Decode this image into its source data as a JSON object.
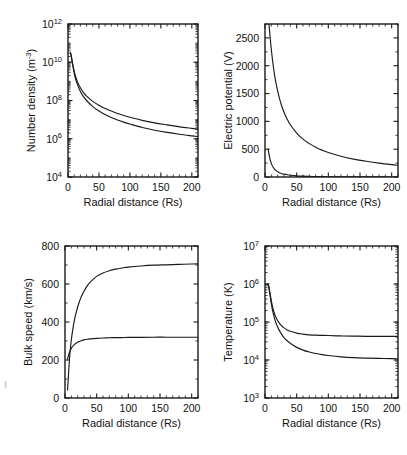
{
  "figure": {
    "background": "#ffffff",
    "ink_color": "#1a1a1a",
    "panel_count": 4
  },
  "common": {
    "xlabel": "Radial distance (Rs)",
    "xticks": [
      0,
      50,
      100,
      150,
      200
    ],
    "xlim": [
      0,
      210
    ]
  },
  "chart_data": [
    {
      "id": "number-density",
      "type": "line",
      "position": "top-left",
      "title": "",
      "xlabel": "Radial distance (Rs)",
      "ylabel": "Number density (m-3)",
      "ylabel_base": "Number density (m",
      "ylabel_sup": "-3",
      "ylabel_tail": ")",
      "yscale": "log",
      "xlim": [
        0,
        210
      ],
      "ylim": [
        10000,
        1000000000000
      ],
      "xticks": [
        0,
        50,
        100,
        150,
        200
      ],
      "yticks": [
        10000,
        1000000,
        100000000,
        10000000000,
        1000000000000
      ],
      "yticklabels": [
        "10^4",
        "10^6",
        "10^8",
        "10^10",
        "10^12"
      ],
      "ytick_mant": [
        "10",
        "10",
        "10",
        "10",
        "10"
      ],
      "ytick_exp": [
        "4",
        "6",
        "8",
        "10",
        "12"
      ],
      "grid": false,
      "legend": "none",
      "series": [
        {
          "name": "upper",
          "x": [
            4,
            5,
            6,
            7,
            8,
            10,
            12,
            15,
            20,
            25,
            30,
            40,
            50,
            60,
            70,
            80,
            90,
            100,
            120,
            140,
            160,
            180,
            200,
            210
          ],
          "y": [
            32000000000.0,
            24000000000.0,
            16000000000.0,
            10500000000.0,
            7000000000.0,
            3400000000.0,
            1900000000.0,
            1000000000.0,
            460000000.0,
            260000000.0,
            170000000.0,
            90000000.0,
            56000000.0,
            38000000.0,
            28000000.0,
            21000000.0,
            16500000.0,
            13300000.0,
            9200000.0,
            6800000.0,
            5300000.0,
            4200000.0,
            3500000.0,
            3200000.0
          ]
        },
        {
          "name": "lower",
          "x": [
            4,
            5,
            6,
            7,
            8,
            10,
            12,
            15,
            20,
            25,
            30,
            40,
            50,
            60,
            70,
            80,
            90,
            100,
            120,
            140,
            160,
            180,
            200,
            210
          ],
          "y": [
            30000000000.0,
            22000000000.0,
            14500000000.0,
            9200000000.0,
            6000000000.0,
            2700000000.0,
            1450000000.0,
            720000000.0,
            300000000.0,
            160000000.0,
            100000000.0,
            48000000.0,
            28000000.0,
            18500000.0,
            13000000.0,
            9600000.0,
            7400000.0,
            5900000.0,
            3900000.0,
            2800000.0,
            2150000.0,
            1720000.0,
            1420000.0,
            1300000.0
          ]
        }
      ]
    },
    {
      "id": "electric-potential",
      "type": "line",
      "position": "top-right",
      "title": "",
      "xlabel": "Radial distance (Rs)",
      "ylabel": "Electric potential (V)",
      "yscale": "linear",
      "xlim": [
        0,
        210
      ],
      "ylim": [
        0,
        2750
      ],
      "xticks": [
        0,
        50,
        100,
        150,
        200
      ],
      "yticks": [
        0,
        500,
        1000,
        1500,
        2000,
        2500
      ],
      "yticklabels": [
        "0",
        "500",
        "1000",
        "1500",
        "2000",
        "2500"
      ],
      "grid": false,
      "legend": "none",
      "series": [
        {
          "name": "upper",
          "x": [
            5,
            6,
            7,
            8,
            9,
            10,
            12,
            15,
            18,
            22,
            26,
            30,
            35,
            40,
            50,
            60,
            70,
            80,
            90,
            100,
            120,
            140,
            160,
            180,
            200,
            210
          ],
          "y": [
            2900,
            2780,
            2650,
            2520,
            2400,
            2290,
            2090,
            1840,
            1650,
            1450,
            1290,
            1165,
            1040,
            940,
            790,
            680,
            600,
            535,
            483,
            440,
            373,
            322,
            283,
            250,
            222,
            210
          ]
        },
        {
          "name": "lower",
          "x": [
            5,
            6,
            7,
            8,
            9,
            10,
            12,
            15,
            18,
            22,
            26,
            30,
            35,
            40,
            50,
            60,
            70,
            80,
            90,
            100,
            120,
            140,
            160,
            180,
            200,
            210
          ],
          "y": [
            500,
            430,
            370,
            318,
            276,
            242,
            192,
            142,
            110,
            82,
            64,
            51,
            40,
            32,
            21,
            15,
            11,
            8,
            6.5,
            5,
            3.2,
            2.2,
            1.6,
            1.2,
            0.9,
            0.8
          ]
        }
      ]
    },
    {
      "id": "bulk-speed",
      "type": "line",
      "position": "bottom-left",
      "title": "",
      "xlabel": "Radial distance (Rs)",
      "ylabel": "Bulk speed (km/s)",
      "yscale": "linear",
      "xlim": [
        0,
        210
      ],
      "ylim": [
        0,
        800
      ],
      "xticks": [
        0,
        50,
        100,
        150,
        200
      ],
      "yticks": [
        0,
        200,
        400,
        600,
        800
      ],
      "yticklabels": [
        "0",
        "200",
        "400",
        "600",
        "800"
      ],
      "grid": false,
      "legend": "none",
      "series": [
        {
          "name": "fast",
          "x": [
            4,
            5,
            6,
            7,
            8,
            10,
            12,
            15,
            18,
            22,
            26,
            30,
            35,
            40,
            50,
            60,
            70,
            80,
            90,
            100,
            120,
            140,
            160,
            180,
            200,
            210
          ],
          "y": [
            42,
            95,
            150,
            200,
            243,
            305,
            355,
            412,
            455,
            500,
            535,
            562,
            590,
            610,
            640,
            658,
            670,
            678,
            684,
            689,
            695,
            699,
            701,
            703,
            705,
            706
          ]
        },
        {
          "name": "slow",
          "x": [
            4,
            5,
            6,
            7,
            8,
            10,
            12,
            15,
            18,
            22,
            26,
            30,
            35,
            40,
            50,
            60,
            70,
            80,
            90,
            100,
            120,
            140,
            160,
            180,
            200,
            210
          ],
          "y": [
            205,
            218,
            230,
            240,
            248,
            261,
            271,
            282,
            290,
            297,
            302,
            306,
            309,
            311,
            314,
            316,
            317,
            318,
            318,
            319,
            319,
            320,
            320,
            320,
            320,
            320
          ]
        }
      ]
    },
    {
      "id": "temperature",
      "type": "line",
      "position": "bottom-right",
      "title": "",
      "xlabel": "Radial distance (Rs)",
      "ylabel": "Temperature (K)",
      "yscale": "log",
      "xlim": [
        0,
        210
      ],
      "ylim": [
        1000,
        10000000
      ],
      "xticks": [
        0,
        50,
        100,
        150,
        200
      ],
      "yticks": [
        1000,
        10000,
        100000,
        1000000,
        10000000
      ],
      "yticklabels": [
        "10^3",
        "10^4",
        "10^5",
        "10^6",
        "10^7"
      ],
      "ytick_mant": [
        "10",
        "10",
        "10",
        "10",
        "10"
      ],
      "ytick_exp": [
        "3",
        "4",
        "5",
        "6",
        "7"
      ],
      "grid": false,
      "legend": "none",
      "series": [
        {
          "name": "upper",
          "x": [
            4,
            5,
            6,
            7,
            8,
            10,
            12,
            15,
            18,
            22,
            26,
            30,
            35,
            40,
            50,
            60,
            70,
            80,
            90,
            100,
            120,
            140,
            160,
            180,
            200,
            210
          ],
          "y": [
            1000000.0,
            980000.0,
            860000.0,
            700000.0,
            560000.0,
            360000.0,
            250000.0,
            165000.0,
            125000.0,
            96000.0,
            80000.0,
            70000.0,
            62000.0,
            57000.0,
            51000.0,
            48000.0,
            46000.0,
            45000.0,
            44500.0,
            44000.0,
            43000.0,
            42500.0,
            42000.0,
            42000.0,
            41800.0,
            41800.0
          ]
        },
        {
          "name": "lower",
          "x": [
            4,
            5,
            6,
            7,
            8,
            10,
            12,
            15,
            18,
            22,
            26,
            30,
            35,
            40,
            50,
            60,
            70,
            80,
            90,
            100,
            120,
            140,
            160,
            180,
            200,
            210
          ],
          "y": [
            1000000.0,
            960000.0,
            820000.0,
            650000.0,
            500000.0,
            300000.0,
            200000.0,
            125000.0,
            88000.0,
            63000.0,
            48000.0,
            39000.0,
            32000.0,
            27500.0,
            21500.0,
            18200.0,
            16200.0,
            14800.0,
            13800.0,
            13100.0,
            12100.0,
            11500.0,
            11200.0,
            11000.0,
            10900.0,
            10800.0
          ]
        }
      ]
    }
  ]
}
